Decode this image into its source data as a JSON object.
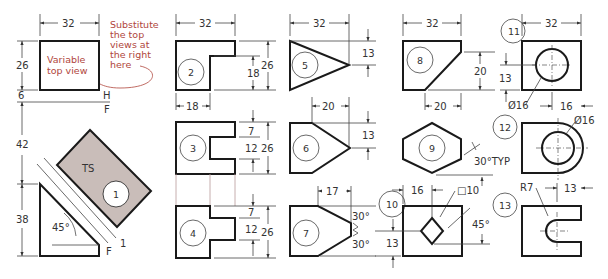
{
  "figure": {
    "shade_color": "#c9bdb9",
    "line_color": "#1a1a1a",
    "note_color": "#b0463c"
  },
  "main_view": {
    "top_view_label_1": "Variable",
    "top_view_label_2": "top view",
    "note_lines": [
      "Substitute",
      "the top",
      "views at",
      "the right",
      "here"
    ],
    "dims": {
      "width": "32",
      "depth": "26",
      "gap_top": "6",
      "gap_mid": "42",
      "front_height": "38",
      "angle": "45°"
    },
    "fold_labels": {
      "h": "H",
      "f_top": "F",
      "f_aux": "F",
      "one": "1"
    },
    "aux_label": "TS",
    "aux_circle": "1"
  },
  "top_views": [
    {
      "id": "2",
      "dims": [
        "32",
        "26",
        "18",
        "18"
      ]
    },
    {
      "id": "3",
      "dims": [
        "7",
        "12",
        "26"
      ]
    },
    {
      "id": "4",
      "dims": [
        "7",
        "12",
        "26"
      ]
    },
    {
      "id": "5",
      "dims": [
        "32",
        "13"
      ]
    },
    {
      "id": "6",
      "dims": [
        "20",
        "13"
      ]
    },
    {
      "id": "7",
      "dims": [
        "17",
        "30°",
        "30°"
      ]
    },
    {
      "id": "8",
      "dims": [
        "32",
        "20",
        "20"
      ]
    },
    {
      "id": "9",
      "dims": [
        "30°TYP"
      ]
    },
    {
      "id": "10",
      "dims": [
        "16",
        "□10",
        "13",
        "45°"
      ]
    },
    {
      "id": "11",
      "dims": [
        "32",
        "13",
        "Ø16",
        "16"
      ]
    },
    {
      "id": "12",
      "dims": [
        "Ø16"
      ]
    },
    {
      "id": "13",
      "dims": [
        "R7",
        "13"
      ]
    }
  ]
}
